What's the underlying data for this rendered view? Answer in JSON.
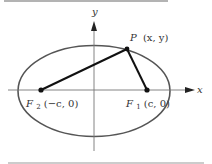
{
  "diagram": {
    "type": "ellipse-foci",
    "colors": {
      "background": "#ffffff",
      "ellipse": "#555555",
      "axes": "#555555",
      "segments": "#111111",
      "points": "#111111",
      "rules": "#9a9a9a",
      "text": "#333333"
    },
    "axes": {
      "x_label": "x",
      "y_label": "y"
    },
    "points": {
      "P": {
        "name": "P",
        "coords": "(x, y)"
      },
      "F1": {
        "name": "F",
        "sub": "1",
        "coords": "(c, 0)"
      },
      "F2": {
        "name": "F",
        "sub": "2",
        "coords": "(−c, 0)"
      }
    }
  }
}
